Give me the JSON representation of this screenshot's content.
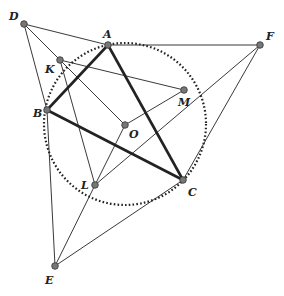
{
  "points": {
    "D": {
      "label": "D",
      "x": 24,
      "y": 24,
      "lx": 9,
      "ly": 20
    },
    "A": {
      "label": "A",
      "x": 108,
      "y": 45,
      "lx": 103,
      "ly": 38
    },
    "F": {
      "label": "F",
      "x": 260,
      "y": 45,
      "lx": 266,
      "ly": 40
    },
    "K": {
      "label": "K",
      "x": 60,
      "y": 60,
      "lx": 45,
      "ly": 73
    },
    "M": {
      "label": "M",
      "x": 184,
      "y": 90,
      "lx": 178,
      "ly": 106
    },
    "B": {
      "label": "B",
      "x": 47,
      "y": 110,
      "lx": 33,
      "ly": 117
    },
    "O": {
      "label": "O",
      "x": 125,
      "y": 125,
      "lx": 129,
      "ly": 138
    },
    "L": {
      "label": "L",
      "x": 95,
      "y": 185,
      "lx": 81,
      "ly": 189
    },
    "C": {
      "label": "C",
      "x": 183,
      "y": 180,
      "lx": 188,
      "ly": 196
    },
    "E": {
      "label": "E",
      "x": 55,
      "y": 266,
      "lx": 45,
      "ly": 284
    }
  },
  "circle": {
    "cx": 125,
    "cy": 124,
    "r": 81
  },
  "thick_segments": [
    [
      "A",
      "B"
    ],
    [
      "B",
      "C"
    ],
    [
      "C",
      "A"
    ]
  ],
  "thin_segments": [
    [
      "D",
      "A"
    ],
    [
      "D",
      "B"
    ],
    [
      "D",
      "O"
    ],
    [
      "A",
      "F"
    ],
    [
      "F",
      "C"
    ],
    [
      "F",
      "L"
    ],
    [
      "K",
      "M"
    ],
    [
      "K",
      "L"
    ],
    [
      "M",
      "O"
    ],
    [
      "O",
      "L"
    ],
    [
      "L",
      "E"
    ],
    [
      "E",
      "C"
    ],
    [
      "B",
      "E"
    ]
  ]
}
